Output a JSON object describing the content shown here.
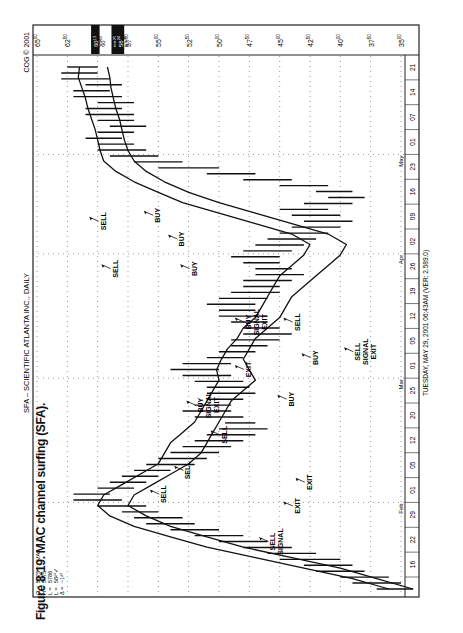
{
  "chart_data": {
    "type": "bar",
    "subtype": "ohlc-range-bars-with-moving-average-channel",
    "title": "SFA – SCIENTIFIC ATLANTA INC., DAILY",
    "copyright": "COG © 2001",
    "footer": "TUESDAY, MAY 29, 2001  06:43AM (VER: 2.589.0)",
    "caption": "Figure 8-19.   MAC channel surfing (SFA).",
    "xlabel": "Date (daily)",
    "ylabel": "Price",
    "ylim": [
      35,
      65
    ],
    "y_ticks": [
      "65.00",
      "62.50",
      "60.00",
      "57.50",
      "55.00",
      "52.50",
      "50.00",
      "47.50",
      "45.00",
      "42.50",
      "40.00",
      "37.50",
      "35.00"
    ],
    "highlighted_price_labels": [
      {
        "label": "60.13",
        "style": "inverse"
      },
      {
        "label": "60.00",
        "style": "normal"
      },
      {
        "label": "58.25",
        "style": "inverse"
      },
      {
        "label": "58.24",
        "style": "inverse"
      },
      {
        "label": "57.50",
        "style": "normal"
      }
    ],
    "x_ticks": [
      "16",
      "22",
      "29",
      "01",
      "05",
      "12",
      "20",
      "25",
      "01",
      "05",
      "12",
      "19",
      "26",
      "02",
      "09",
      "16",
      "23",
      "01",
      "07",
      "14",
      "21"
    ],
    "month_labels": [
      {
        "label": "Feb",
        "at_index": 3
      },
      {
        "label": "Mar",
        "at_index": 8
      },
      {
        "label": "Apr",
        "at_index": 13
      },
      {
        "label": "May",
        "at_index": 17
      }
    ],
    "stats": {
      "O": "5975",
      "H": "5975",
      "L1": "5786",
      "L2": "58²⁴",
      "delta": "−1²⁴",
      "indicator": "MAx"
    },
    "series": [
      {
        "name": "MAC upper (high MA)",
        "values": [
          36,
          39,
          43,
          47,
          51,
          54,
          57,
          59,
          60,
          59.5,
          58,
          56.5,
          55,
          54.5,
          54,
          53,
          52,
          51.5,
          51,
          50.5,
          50,
          50.2,
          49.8,
          49.3,
          48.5,
          48,
          47,
          46.5,
          46,
          45.5,
          45,
          44,
          43,
          42.5,
          44,
          47,
          50,
          53,
          55,
          57,
          58.5,
          59.5,
          59.8,
          60,
          60.2,
          60.5,
          60.8,
          61,
          61.3,
          61.6,
          61.5
        ]
      },
      {
        "name": "MAC lower (low MA)",
        "values": [
          34,
          37,
          40,
          44,
          48,
          51,
          54,
          56,
          57.5,
          57,
          55.5,
          54,
          52.5,
          51.5,
          51,
          50.5,
          50,
          49.5,
          49,
          48,
          47,
          47.5,
          48,
          47.5,
          47,
          46,
          45,
          44.5,
          44,
          43,
          42,
          41,
          40,
          39.5,
          41,
          44,
          47,
          50,
          52.5,
          54.5,
          56,
          57,
          57.5,
          57.8,
          58,
          58.2,
          58.5,
          58.7,
          58.9,
          59,
          59.2
        ]
      }
    ],
    "price_bars": [
      [
        34,
        37
      ],
      [
        35,
        39
      ],
      [
        36,
        40
      ],
      [
        38,
        42
      ],
      [
        39,
        43
      ],
      [
        40,
        45
      ],
      [
        42,
        46
      ],
      [
        44,
        48
      ],
      [
        46,
        50
      ],
      [
        48,
        52
      ],
      [
        50,
        54
      ],
      [
        52,
        56
      ],
      [
        53,
        57
      ],
      [
        55,
        58
      ],
      [
        56,
        60
      ],
      [
        58,
        62
      ],
      [
        59,
        62
      ],
      [
        57,
        60
      ],
      [
        56,
        59
      ],
      [
        55,
        58
      ],
      [
        54,
        57
      ],
      [
        52,
        56
      ],
      [
        51,
        55
      ],
      [
        50,
        54
      ],
      [
        49,
        53
      ],
      [
        48,
        52
      ],
      [
        47,
        51
      ],
      [
        46,
        50
      ],
      [
        47,
        49.5
      ],
      [
        48,
        52
      ],
      [
        49,
        53
      ],
      [
        49,
        52
      ],
      [
        48,
        51
      ],
      [
        47,
        51
      ],
      [
        47.5,
        51
      ],
      [
        48,
        52
      ],
      [
        49,
        53
      ],
      [
        50,
        54
      ],
      [
        49,
        53
      ],
      [
        48,
        51
      ],
      [
        47,
        50
      ],
      [
        46,
        49
      ],
      [
        45,
        49
      ],
      [
        44,
        48
      ],
      [
        45,
        48
      ],
      [
        46,
        49
      ],
      [
        46,
        50
      ],
      [
        47,
        50
      ],
      [
        47,
        51
      ],
      [
        46,
        50
      ],
      [
        45,
        49
      ],
      [
        45,
        48
      ],
      [
        44,
        48
      ],
      [
        43,
        47
      ],
      [
        44,
        47
      ],
      [
        45,
        48
      ],
      [
        45,
        49
      ],
      [
        44,
        48
      ],
      [
        43,
        47
      ],
      [
        42,
        46
      ],
      [
        41,
        45
      ],
      [
        40,
        44
      ],
      [
        39,
        43
      ],
      [
        40,
        44
      ],
      [
        41,
        45
      ],
      [
        39,
        43
      ],
      [
        38,
        41
      ],
      [
        39,
        42
      ],
      [
        41,
        45
      ],
      [
        44,
        48
      ],
      [
        47,
        51
      ],
      [
        50,
        55
      ],
      [
        53,
        57
      ],
      [
        55,
        59
      ],
      [
        56,
        60
      ],
      [
        57,
        60
      ],
      [
        58,
        61
      ],
      [
        57,
        60
      ],
      [
        56,
        59
      ],
      [
        57,
        60
      ],
      [
        57,
        61
      ],
      [
        58,
        61
      ],
      [
        57,
        60
      ],
      [
        58,
        62
      ],
      [
        59,
        62
      ],
      [
        58,
        61
      ],
      [
        59,
        63
      ],
      [
        60,
        63
      ],
      [
        60,
        62.5
      ]
    ],
    "annotations": [
      {
        "text": "SELL",
        "x_idx": 16,
        "price": 56
      },
      {
        "text": "SELL",
        "x_idx": 20,
        "price": 54
      },
      {
        "text": "SELL SIGNAL",
        "x_idx": 8,
        "price": 47
      },
      {
        "text": "EXIT",
        "x_idx": 14,
        "price": 45
      },
      {
        "text": "EXIT",
        "x_idx": 18,
        "price": 44
      },
      {
        "text": "SELL",
        "x_idx": 26,
        "price": 51
      },
      {
        "text": "BUY SIGNAL EXIT",
        "x_idx": 31,
        "price": 53
      },
      {
        "text": "BUY",
        "x_idx": 32,
        "price": 45.5
      },
      {
        "text": "EXIT",
        "x_idx": 37,
        "price": 49
      },
      {
        "text": "BUY",
        "x_idx": 39,
        "price": 43.5
      },
      {
        "text": "SELL SIGNAL EXIT",
        "x_idx": 40,
        "price": 40
      },
      {
        "text": "BUY SIGNAL EXIT",
        "x_idx": 45,
        "price": 49
      },
      {
        "text": "SELL",
        "x_idx": 45,
        "price": 45
      },
      {
        "text": "SELL",
        "x_idx": 54,
        "price": 60
      },
      {
        "text": "BUY",
        "x_idx": 54,
        "price": 53.5
      },
      {
        "text": "BUY",
        "x_idx": 59,
        "price": 54.5
      },
      {
        "text": "SELL",
        "x_idx": 62,
        "price": 61
      },
      {
        "text": "BUY",
        "x_idx": 63,
        "price": 56.5
      }
    ],
    "grid": true,
    "legend": "none"
  },
  "labels": {
    "title": "SFA – SCIENTIFIC ATLANTA INC., DAILY",
    "copyright": "COG © 2001",
    "footer": "TUESDAY, MAY 29, 2001  06:43AM (VER: 2.589.0)",
    "caption": "Figure 8-19.   MAC channel surfing (SFA).",
    "stat_O": "O =",
    "stat_H": "H =",
    "stat_L1": "L =",
    "stat_L2": "L =",
    "stat_D": "Δ =",
    "val_O": "5975",
    "val_H": "5975",
    "val_L1": "5786",
    "val_L2": "58²⁴✓",
    "val_D": "−1²⁴",
    "indicator": "MAx"
  }
}
